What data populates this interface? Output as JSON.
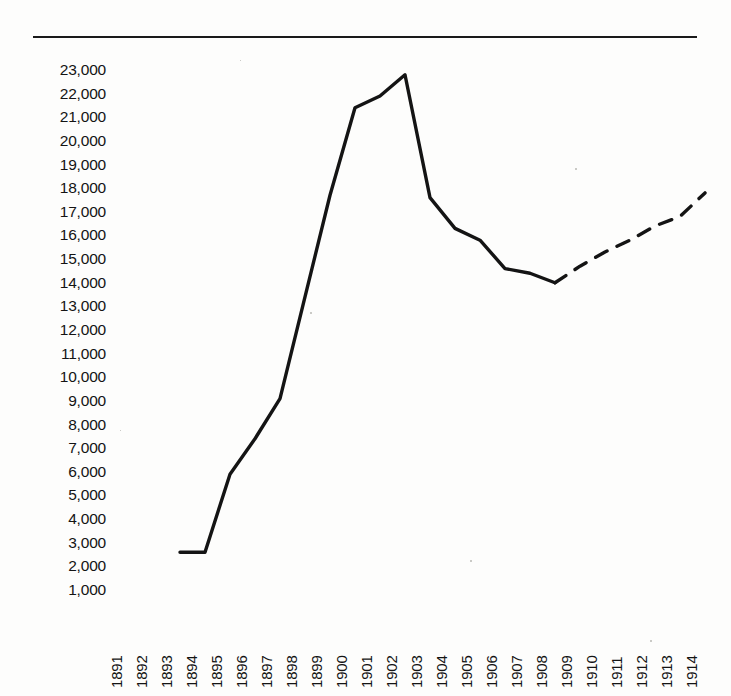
{
  "figure": {
    "background_color": "#fdfdfc",
    "ink_color": "#141414",
    "top_rule": true
  },
  "chart_data": {
    "type": "line",
    "title": "",
    "subtitle": "",
    "xlabel": "",
    "ylabel": "",
    "grid": false,
    "legend": "none",
    "x": [
      1891,
      1892,
      1893,
      1894,
      1895,
      1896,
      1897,
      1898,
      1899,
      1900,
      1901,
      1902,
      1903,
      1904,
      1905,
      1906,
      1907,
      1908,
      1909,
      1910,
      1911,
      1912,
      1913,
      1914
    ],
    "xtick_labels": [
      "1891",
      "1892",
      "1893",
      "1894",
      "1895",
      "1896",
      "1897",
      "1898",
      "1899",
      "1900",
      "1901",
      "1902",
      "1903",
      "1904",
      "1905",
      "1906",
      "1907",
      "1908",
      "1909",
      "1910",
      "1911",
      "1912",
      "1913",
      "1914"
    ],
    "ytick_labels": [
      "23,000",
      "22,000",
      "21,000",
      "20,000",
      "19,000",
      "18,000",
      "17,000",
      "16,000",
      "15,000",
      "14,000",
      "13,000",
      "12,000",
      "11,000",
      "10,000",
      "9,000",
      "8,000",
      "7,000",
      "6,000",
      "5,000",
      "4,000",
      "3,000",
      "2,000",
      "1,000"
    ],
    "ytick_values": [
      23000,
      22000,
      21000,
      20000,
      19000,
      18000,
      17000,
      16000,
      15000,
      14000,
      13000,
      12000,
      11000,
      10000,
      9000,
      8000,
      7000,
      6000,
      5000,
      4000,
      3000,
      2000,
      1000
    ],
    "ylim": [
      500,
      23500
    ],
    "xlim": [
      1890.5,
      1914.5
    ],
    "series": [
      {
        "name": "actual",
        "style": "solid",
        "color": "#141414",
        "points": [
          {
            "x": 1893,
            "y": 2600
          },
          {
            "x": 1894,
            "y": 2600
          },
          {
            "x": 1895,
            "y": 5900
          },
          {
            "x": 1896,
            "y": 7400
          },
          {
            "x": 1897,
            "y": 9100
          },
          {
            "x": 1898,
            "y": 13400
          },
          {
            "x": 1899,
            "y": 17700
          },
          {
            "x": 1900,
            "y": 21400
          },
          {
            "x": 1901,
            "y": 21900
          },
          {
            "x": 1902,
            "y": 22800
          },
          {
            "x": 1903,
            "y": 17600
          },
          {
            "x": 1904,
            "y": 16300
          },
          {
            "x": 1905,
            "y": 15800
          },
          {
            "x": 1906,
            "y": 14600
          },
          {
            "x": 1907,
            "y": 14400
          },
          {
            "x": 1908,
            "y": 14000
          }
        ]
      },
      {
        "name": "projected",
        "style": "dashed",
        "color": "#141414",
        "points": [
          {
            "x": 1908,
            "y": 14000
          },
          {
            "x": 1909,
            "y": 14700
          },
          {
            "x": 1910,
            "y": 15300
          },
          {
            "x": 1911,
            "y": 15800
          },
          {
            "x": 1912,
            "y": 16400
          },
          {
            "x": 1913,
            "y": 16800
          },
          {
            "x": 1914,
            "y": 17800
          }
        ]
      }
    ]
  }
}
